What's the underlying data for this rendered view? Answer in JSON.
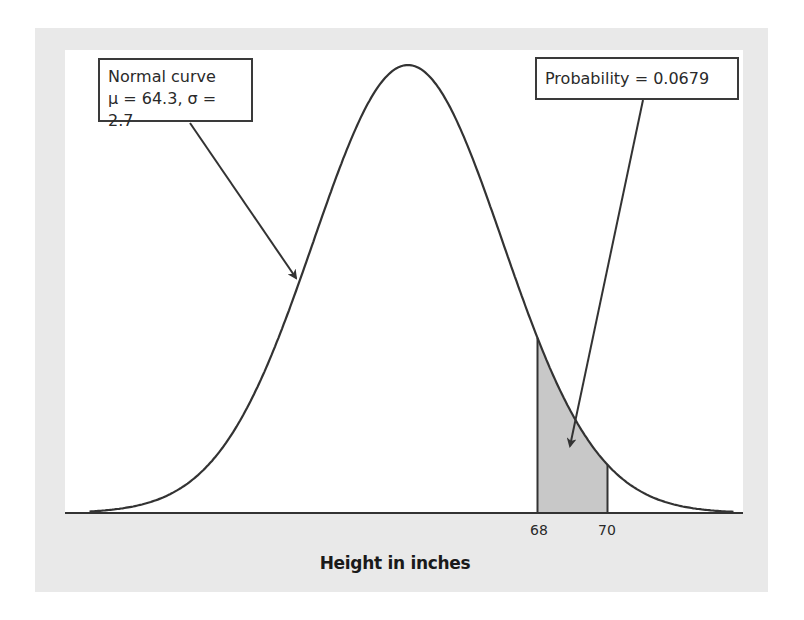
{
  "chart_data": {
    "type": "area",
    "title": "",
    "xlabel": "Height in inches",
    "ylabel": "",
    "distribution": "normal",
    "mean": 64.3,
    "sd": 2.7,
    "shaded_region": {
      "from": 68,
      "to": 70,
      "probability": 0.0679
    },
    "x_ticks": [
      68,
      70
    ],
    "grid": false,
    "annotations": [
      {
        "text": [
          "Normal curve",
          "μ = 64.3, σ = 2.7"
        ],
        "points_to": "curve"
      },
      {
        "text": [
          "Probability = 0.0679"
        ],
        "points_to": "shaded_region"
      }
    ]
  },
  "labels": {
    "normal_line1": "Normal curve",
    "normal_line2": "μ = 64.3, σ = 2.7",
    "probability": "Probability = 0.0679",
    "tick_68": "68",
    "tick_70": "70",
    "axis_title": "Height in inches"
  },
  "colors": {
    "frame": "#e9e9e9",
    "curve": "#333333",
    "shade": "#c8c8c8"
  }
}
